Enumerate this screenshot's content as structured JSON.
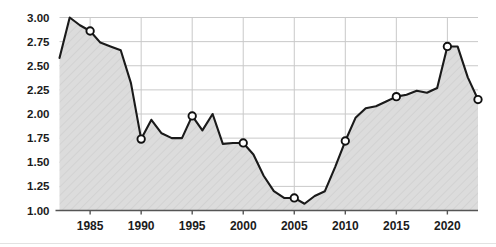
{
  "chart_data": {
    "type": "area",
    "title": "",
    "subtitle": "",
    "xlabel": "",
    "ylabel": "",
    "xlim": [
      1982,
      2023
    ],
    "ylim": [
      1.0,
      3.0
    ],
    "grid": true,
    "legend": null,
    "x_ticks": [
      "1985",
      "1990",
      "1995",
      "2000",
      "2005",
      "2010",
      "2015",
      "2020"
    ],
    "x_tick_values": [
      1985,
      1990,
      1995,
      2000,
      2005,
      2010,
      2015,
      2020
    ],
    "y_ticks": [
      "1.00",
      "1.25",
      "1.50",
      "1.75",
      "2.00",
      "2.25",
      "2.50",
      "2.75",
      "3.00"
    ],
    "y_tick_values": [
      1.0,
      1.25,
      1.5,
      1.75,
      2.0,
      2.25,
      2.5,
      2.75,
      3.0
    ],
    "series": [
      {
        "name": "value",
        "x": [
          1982,
          1983,
          1984,
          1985,
          1986,
          1987,
          1988,
          1989,
          1990,
          1991,
          1992,
          1993,
          1994,
          1995,
          1996,
          1997,
          1998,
          1999,
          2000,
          2001,
          2002,
          2003,
          2004,
          2005,
          2006,
          2007,
          2008,
          2009,
          2010,
          2011,
          2012,
          2013,
          2014,
          2015,
          2016,
          2017,
          2018,
          2019,
          2020,
          2021,
          2022,
          2023
        ],
        "values": [
          2.58,
          3.0,
          2.92,
          2.86,
          2.74,
          2.7,
          2.66,
          2.32,
          1.74,
          1.94,
          1.8,
          1.75,
          1.75,
          1.98,
          1.83,
          2.0,
          1.69,
          1.7,
          1.7,
          1.58,
          1.36,
          1.2,
          1.13,
          1.13,
          1.07,
          1.15,
          1.2,
          1.45,
          1.72,
          1.96,
          2.06,
          2.08,
          2.13,
          2.18,
          2.2,
          2.24,
          2.22,
          2.27,
          2.7,
          2.7,
          2.38,
          2.15
        ],
        "markers_at_x": [
          1985,
          1990,
          1995,
          2000,
          2005,
          2010,
          2015,
          2020,
          2023
        ],
        "marker_values": [
          2.86,
          1.74,
          1.98,
          1.7,
          1.13,
          1.72,
          2.18,
          2.7,
          2.15
        ]
      }
    ],
    "colors": {
      "line": "#1a1a1a",
      "fill": "#d8d8d8",
      "marker_face": "#ffffff",
      "marker_edge": "#111111",
      "grid": "#c9c9c9",
      "axis": "#555555",
      "text": "#1b1b1b",
      "background": "#ffffff"
    }
  }
}
